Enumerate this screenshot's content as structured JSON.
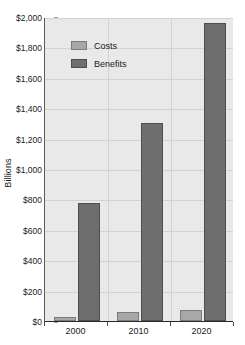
{
  "chart_data": {
    "type": "bar",
    "title": "",
    "subtitle": "",
    "xlabel": "",
    "ylabel": "Billions",
    "categories": [
      "2000",
      "2010",
      "2020"
    ],
    "series": [
      {
        "name": "Costs",
        "values": [
          25,
          60,
          70
        ],
        "color": "#a8a8a8"
      },
      {
        "name": "Benefits",
        "values": [
          775,
          1300,
          1960
        ],
        "color": "#6e6e6e"
      }
    ],
    "ylim": [
      0,
      2000
    ],
    "ytick_values": [
      0,
      200,
      400,
      600,
      800,
      1000,
      1200,
      1400,
      1600,
      1800,
      2000
    ],
    "ytick_labels": [
      "$0",
      "$200",
      "$400",
      "$600",
      "$800",
      "$1,000",
      "$1,200",
      "$1,400",
      "$1,600",
      "$1,800",
      "$2,000"
    ],
    "grid": true,
    "grid_axis": "both",
    "legend_position": "upper-left-inside",
    "legend_entries": [
      "Costs",
      "Benefits"
    ],
    "plot_background": "#e9e9e9",
    "figure_background": "#ffffff",
    "annotations": []
  },
  "legend": {
    "items": [
      {
        "label": "Costs",
        "swatch": "legend-swatch-costs"
      },
      {
        "label": "Benefits",
        "swatch": "legend-swatch-benefits"
      }
    ]
  },
  "axes": {
    "y_title": "Billions"
  }
}
